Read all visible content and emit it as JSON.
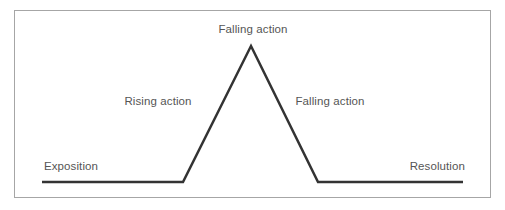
{
  "figure": {
    "type": "plot-diagram",
    "background_color": "#ffffff",
    "border_color": "#a6a6a6",
    "line_color": "#333333",
    "text_color": "#555555"
  },
  "labels": {
    "climax": "Falling action",
    "rising_action": "Rising action",
    "falling_action": "Falling action",
    "exposition": "Exposition",
    "resolution": "Resolution"
  },
  "chart_data": {
    "type": "line",
    "title": "",
    "xlabel": "",
    "ylabel": "",
    "grid": false,
    "legend": "none",
    "xlim": [
      0,
      505
    ],
    "ylim": [
      210,
      0
    ],
    "series": [
      {
        "name": "plot-arc",
        "points": [
          [
            42,
            182
          ],
          [
            183,
            182
          ],
          [
            251,
            46
          ],
          [
            318,
            182
          ],
          [
            463,
            182
          ]
        ],
        "color": "#333333",
        "line_width": 2.5
      }
    ],
    "annotations": [
      {
        "text": "Falling action",
        "x": 253,
        "y": 30,
        "anchor": "middle",
        "name": "climax"
      },
      {
        "text": "Rising action",
        "x": 158,
        "y": 104,
        "anchor": "middle",
        "name": "rising-action"
      },
      {
        "text": "Falling action",
        "x": 330,
        "y": 104,
        "anchor": "middle",
        "name": "falling-action"
      },
      {
        "text": "Exposition",
        "x": 44,
        "y": 170,
        "anchor": "start",
        "name": "exposition"
      },
      {
        "text": "Resolution",
        "x": 465,
        "y": 170,
        "anchor": "end",
        "name": "resolution"
      }
    ]
  }
}
